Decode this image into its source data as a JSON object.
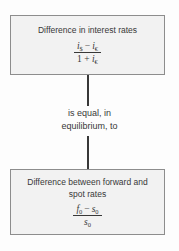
{
  "diagram": {
    "top_box": {
      "title": "Difference in interest rates",
      "formula": {
        "num_var1": "i",
        "num_sub1": "$",
        "minus": "−",
        "num_var2": "i",
        "num_sub2": "€",
        "den_prefix": "1 + ",
        "den_var": "i",
        "den_sub": "€"
      }
    },
    "connector": {
      "label_line1": "is equal, in",
      "label_line2": "equilibrium, to"
    },
    "bottom_box": {
      "title_line1": "Difference between forward and",
      "title_line2": "spot rates",
      "formula": {
        "num_var1": "f",
        "num_sub1": "0",
        "minus": "−",
        "num_var2": "s",
        "num_sub2": "0",
        "den_var": "s",
        "den_sub": "0"
      }
    },
    "colors": {
      "page_bg": "#fdfdfd",
      "box_fill": "#f2f2f2",
      "box_border": "#8d8d8d",
      "text": "#383838",
      "line": "#383838"
    }
  }
}
